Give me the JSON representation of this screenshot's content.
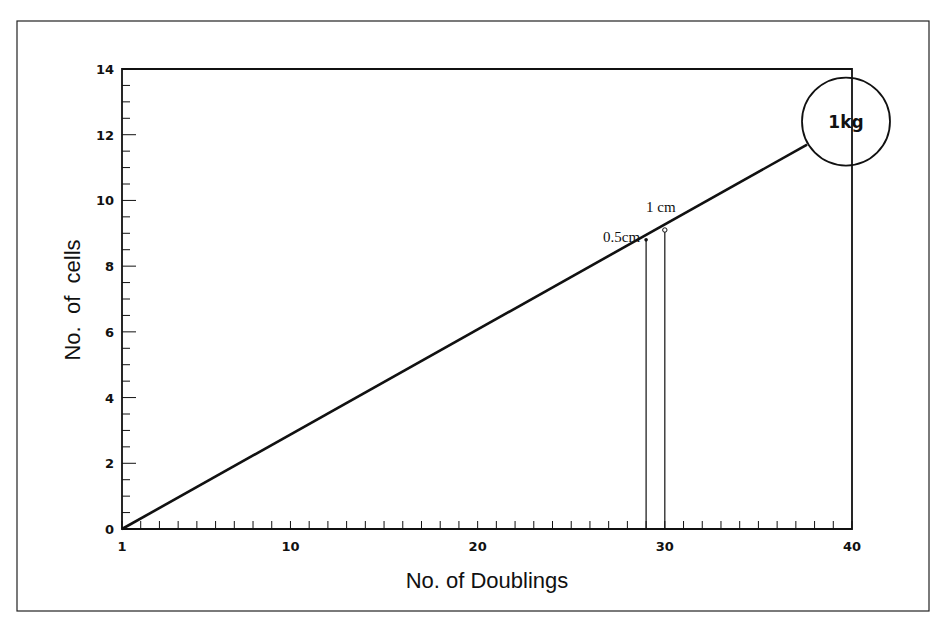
{
  "chart_data": {
    "type": "line",
    "title": "",
    "xlabel": "No. of Doublings",
    "ylabel": "No.  of  cells",
    "xlim": [
      1,
      40
    ],
    "ylim": [
      0,
      14
    ],
    "xticks": [
      1,
      10,
      20,
      30,
      40
    ],
    "yticks": [
      0,
      2,
      4,
      6,
      8,
      10,
      12,
      14
    ],
    "x_minor_step": 1,
    "y_minor_step": 0.5,
    "grid": false,
    "legend": null,
    "series": [
      {
        "name": "cell growth (log10 cells)",
        "x": [
          1,
          37.6
        ],
        "y": [
          0,
          11.7
        ]
      }
    ],
    "annotations": [
      {
        "label": "0.5cm",
        "x": 29,
        "y": 8.8,
        "marker": "dot",
        "drop_line": true
      },
      {
        "label": "1 cm",
        "x": 30,
        "y": 9.1,
        "marker": "open-circle",
        "drop_line": true
      },
      {
        "label": "1kg",
        "x": 40,
        "y": 12.4,
        "shape": "circle"
      }
    ]
  },
  "colors": {
    "ink": "#111111",
    "background": "#ffffff"
  }
}
